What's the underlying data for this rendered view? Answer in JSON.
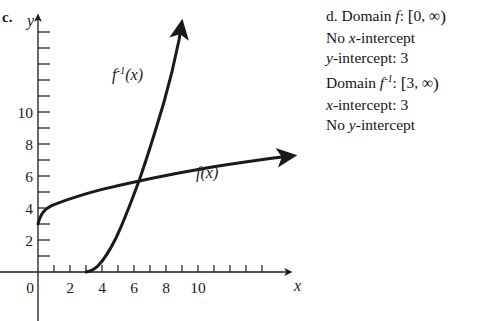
{
  "figure": {
    "part_label": "c.",
    "axis_label_y": "y",
    "axis_label_x": "x",
    "origin_label": "0",
    "curve_label_f": "f(x)",
    "curve_label_finv_base": "f",
    "curve_label_finv_exp": "-1",
    "curve_label_finv_arg": "(x)",
    "y_ticks_major": [
      "10",
      "8",
      "6",
      "4",
      "2"
    ],
    "x_ticks_major": [
      "2",
      "4",
      "6",
      "8",
      "10"
    ],
    "ink_color": "#1a1a1a"
  },
  "chart_data": {
    "type": "line",
    "title": "",
    "xlabel": "x",
    "ylabel": "y",
    "xlim": [
      -0.6,
      11.6
    ],
    "ylim": [
      -1.0,
      11.6
    ],
    "grid": false,
    "x_tick_values": [
      0,
      1,
      2,
      3,
      4,
      5,
      6,
      7,
      8,
      9,
      10
    ],
    "x_tick_labels": [
      "0",
      "",
      "2",
      "",
      "4",
      "",
      "6",
      "",
      "8",
      "",
      "10"
    ],
    "y_tick_values": [
      1,
      2,
      3,
      4,
      5,
      6,
      7,
      8,
      9,
      10
    ],
    "y_tick_labels": [
      "",
      "2",
      "",
      "4",
      "",
      "6",
      "",
      "8",
      "",
      "10"
    ],
    "legend": "inline labels",
    "series": [
      {
        "name": "f(x)",
        "equation": "f(x) = sqrt(x) + 3",
        "label_position": [
          6.6,
          4.3
        ],
        "domain": [
          0,
          11.3
        ],
        "x": [
          0,
          0.25,
          0.5,
          1,
          1.5,
          2,
          3,
          4,
          5,
          6,
          7,
          8,
          9,
          10,
          11.3
        ],
        "y": [
          3.0,
          3.5,
          3.71,
          4.0,
          4.22,
          4.41,
          4.73,
          5.0,
          5.24,
          5.45,
          5.65,
          5.83,
          6.0,
          6.16,
          6.36
        ]
      },
      {
        "name": "f^-1(x)",
        "equation": "f^-1(x) = (x - 3)^2",
        "label_position": [
          4.6,
          8.4
        ],
        "domain": [
          3,
          6.05
        ],
        "x": [
          3,
          3.25,
          3.5,
          3.75,
          4,
          4.25,
          4.5,
          4.75,
          5,
          5.25,
          5.5,
          5.75,
          6,
          6.05
        ],
        "y": [
          0,
          0.06,
          0.25,
          0.56,
          1.0,
          1.56,
          2.25,
          3.06,
          4.0,
          5.06,
          6.25,
          7.56,
          9.0,
          9.3
        ]
      }
    ],
    "annotations": [
      {
        "text": "intersection on y = x",
        "x": 5.3,
        "y": 5.3
      }
    ]
  },
  "answer": {
    "part_label": "d.",
    "lines": [
      {
        "id": "domain-f",
        "prefix": "Domain ",
        "var": "f",
        "inv": "",
        "mid": ": ",
        "interval": "[0, ∞)"
      },
      {
        "id": "no-x-int",
        "plain_a": "No ",
        "var": "x",
        "plain_b": "-intercept"
      },
      {
        "id": "y-int",
        "var": "y",
        "plain_b": "-intercept: 3"
      },
      {
        "id": "domain-finv",
        "prefix": "Domain ",
        "var": "f",
        "inv": "-1",
        "mid": ": ",
        "interval": "[3, ∞)"
      },
      {
        "id": "x-int",
        "var": "x",
        "plain_b": "-intercept: 3"
      },
      {
        "id": "no-y-int",
        "plain_a": "No ",
        "var": "y",
        "plain_b": "-intercept"
      }
    ],
    "text_domain_f": "Domain f: [0, ∞)",
    "text_no_x_intercept": "No x-intercept",
    "text_y_intercept": "y-intercept: 3",
    "text_domain_finv": "Domain f⁻¹: [3, ∞)",
    "text_x_intercept": "x-intercept: 3",
    "text_no_y_intercept": "No y-intercept"
  }
}
